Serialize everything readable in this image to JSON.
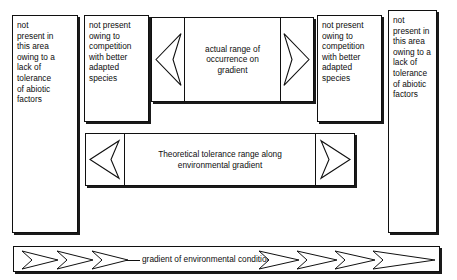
{
  "figure": {
    "ink_color": "#101010",
    "background_color": "#ffffff"
  },
  "panels": {
    "left_outer": {
      "text": "not\npresent in\nthis area\nowing to a\nlack of\ntolerance\nof abiotic\nfactors"
    },
    "left_inner": {
      "text": "not present\nowing to\ncompetition\nwith better\nadapted\nspecies"
    },
    "center": {
      "text": "actual range of\noccurrence on\ngradient"
    },
    "right_inner": {
      "text": "not present\nowing to\ncompetition\nwith better\nadapted\nspecies"
    },
    "right_outer": {
      "text": "not\npresent in\nthis area\nowing to a\nlack of\ntolerance\nof abiotic\nfactors"
    }
  },
  "theoretical_bar": {
    "text": "Theoretical tolerance range along\nenvironmental gradient"
  },
  "gradient_bar": {
    "text": "gradient of environmental conditions",
    "left_chevron_count": 3,
    "right_chevron_count": 3
  },
  "icons": {
    "left_arrow": "arrow-left-icon",
    "right_arrow": "arrow-right-icon",
    "chevron_right": "chevron-right-icon"
  }
}
